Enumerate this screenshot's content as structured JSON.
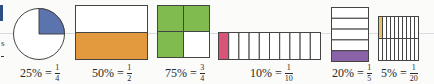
{
  "figures": [
    {
      "id": "quarter-circle",
      "percent": "25%",
      "numerator": "1",
      "denominator": "4",
      "shape": "pie",
      "shaded_fraction": 0.25,
      "fill": "#5b74ad"
    },
    {
      "id": "half-rect",
      "percent": "50%",
      "numerator": "1",
      "denominator": "2",
      "shape": "rows",
      "parts": 2,
      "shaded": [
        1
      ],
      "fill": "#e39a3f"
    },
    {
      "id": "three-quarter-grid",
      "percent": "75%",
      "numerator": "3",
      "denominator": "4",
      "shape": "grid2x2",
      "shaded": [
        0,
        1,
        2
      ],
      "fill": "#7fbb4f"
    },
    {
      "id": "tenth-strip",
      "percent": "10%",
      "numerator": "1",
      "denominator": "10",
      "shape": "cols",
      "parts": 10,
      "shaded": [
        0
      ],
      "fill": "#d65577"
    },
    {
      "id": "fifth-stack",
      "percent": "20%",
      "numerator": "1",
      "denominator": "5",
      "shape": "rows",
      "parts": 5,
      "shaded": [
        4
      ],
      "fill": "#8a62a8"
    },
    {
      "id": "twentieth-grid",
      "percent": "5%",
      "numerator": "1",
      "denominator": "20",
      "shape": "grid10x2",
      "shaded": [
        0
      ],
      "fill": "#e7c567"
    }
  ],
  "equals": "="
}
